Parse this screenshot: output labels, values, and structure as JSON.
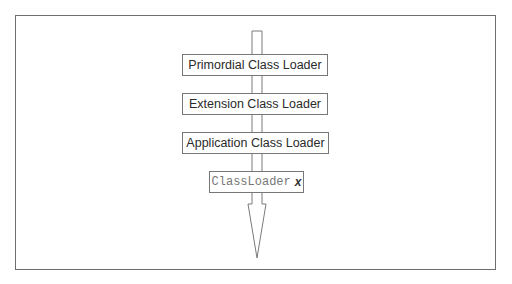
{
  "diagram": {
    "type": "class-loader-hierarchy",
    "direction": "top-to-bottom",
    "boxes": [
      {
        "label": "Primordial Class Loader"
      },
      {
        "label": "Extension Class Loader"
      },
      {
        "label": "Application Class Loader"
      },
      {
        "label_code": "ClassLoader",
        "label_var": "x"
      }
    ],
    "colors": {
      "stroke": "#777777",
      "text": "#2a2a2a",
      "background": "#ffffff"
    }
  }
}
